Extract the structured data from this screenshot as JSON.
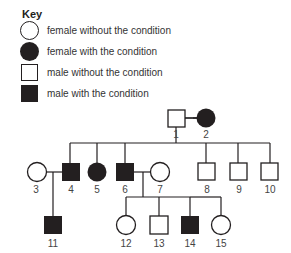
{
  "key": {
    "title": "Key",
    "items": [
      {
        "symbol": "circle-open",
        "label": "female without the condition"
      },
      {
        "symbol": "circle-filled",
        "label": "female with the condition"
      },
      {
        "symbol": "square-open",
        "label": "male without the condition"
      },
      {
        "symbol": "square-filled",
        "label": "male with the condition"
      }
    ]
  },
  "pedigree": {
    "individuals": [
      {
        "id": "1",
        "sex": "male",
        "affected": false,
        "generation": 1
      },
      {
        "id": "2",
        "sex": "female",
        "affected": true,
        "generation": 1
      },
      {
        "id": "3",
        "sex": "female",
        "affected": false,
        "generation": 2
      },
      {
        "id": "4",
        "sex": "male",
        "affected": true,
        "generation": 2
      },
      {
        "id": "5",
        "sex": "female",
        "affected": true,
        "generation": 2
      },
      {
        "id": "6",
        "sex": "male",
        "affected": true,
        "generation": 2
      },
      {
        "id": "7",
        "sex": "female",
        "affected": false,
        "generation": 2
      },
      {
        "id": "8",
        "sex": "male",
        "affected": false,
        "generation": 2
      },
      {
        "id": "9",
        "sex": "male",
        "affected": false,
        "generation": 2
      },
      {
        "id": "10",
        "sex": "male",
        "affected": false,
        "generation": 2
      },
      {
        "id": "11",
        "sex": "male",
        "affected": true,
        "generation": 3
      },
      {
        "id": "12",
        "sex": "female",
        "affected": false,
        "generation": 3
      },
      {
        "id": "13",
        "sex": "male",
        "affected": false,
        "generation": 3
      },
      {
        "id": "14",
        "sex": "male",
        "affected": true,
        "generation": 3
      },
      {
        "id": "15",
        "sex": "female",
        "affected": false,
        "generation": 3
      }
    ],
    "couples": [
      [
        "1",
        "2"
      ],
      [
        "3",
        "4"
      ],
      [
        "6",
        "7"
      ]
    ],
    "children": {
      "1-2": [
        "4",
        "5",
        "6",
        "8",
        "9",
        "10"
      ],
      "3-4": [
        "11"
      ],
      "6-7": [
        "12",
        "13",
        "14",
        "15"
      ]
    }
  }
}
